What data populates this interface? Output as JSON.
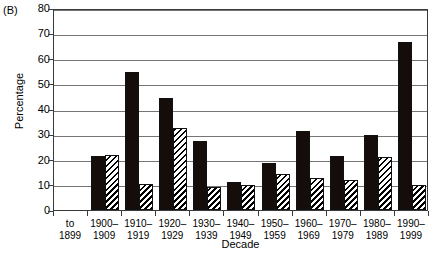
{
  "figure": {
    "panel_label": "(B)",
    "xlabel": "Decade",
    "ylabel": "Percentage"
  },
  "chart_data": {
    "type": "bar",
    "title": "",
    "subtitle": "",
    "panel": "(B)",
    "xlabel": "Decade",
    "ylabel": "Percentage",
    "ylim": [
      0,
      80
    ],
    "yticks": [
      0,
      10,
      20,
      30,
      40,
      50,
      60,
      70,
      80
    ],
    "ytick_labels": [
      "0",
      "10",
      "20",
      "30",
      "40",
      "50",
      "60",
      "70",
      "80"
    ],
    "grid": "horizontal",
    "legend": "none",
    "categories": [
      "to 1899",
      "1900–1909",
      "1910–1919",
      "1920–1929",
      "1930–1939",
      "1940–1949",
      "1950–1959",
      "1960–1969",
      "1970–1979",
      "1980–1989",
      "1990–1999"
    ],
    "category_lines": [
      [
        "to",
        "1899"
      ],
      [
        "1900–",
        "1909"
      ],
      [
        "1910–",
        "1919"
      ],
      [
        "1920–",
        "1929"
      ],
      [
        "1930–",
        "1939"
      ],
      [
        "1940–",
        "1949"
      ],
      [
        "1950–",
        "1959"
      ],
      [
        "1960–",
        "1969"
      ],
      [
        "1970–",
        "1979"
      ],
      [
        "1980–",
        "1989"
      ],
      [
        "1990–",
        "1999"
      ]
    ],
    "series": [
      {
        "name": "solid-black",
        "fill": "solid",
        "color": "#140d0a",
        "values": [
          0,
          21.5,
          54.8,
          44.2,
          27.5,
          11.2,
          18.8,
          31.2,
          21.5,
          29.8,
          66.7
        ]
      },
      {
        "name": "diagonal-hatched",
        "fill": "diagonal-hatch",
        "color": "#ffffff",
        "values": [
          0,
          21.6,
          10.5,
          32.3,
          9.2,
          9.8,
          14.3,
          12.8,
          11.9,
          21.0,
          9.8
        ]
      }
    ]
  }
}
